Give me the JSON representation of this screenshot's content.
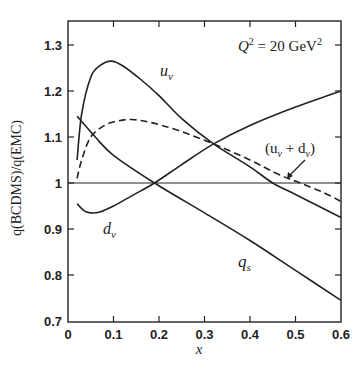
{
  "chart_data": {
    "type": "line",
    "title": "",
    "annotation": "Q² = 20 GeV²",
    "annotation_parts": {
      "q": "Q",
      "sup1": "2",
      "eq": " = 20 GeV",
      "sup2": "2"
    },
    "xlabel": "x",
    "ylabel": "q(BCDMS)/q(EMC)",
    "xlim": [
      0,
      0.6
    ],
    "ylim": [
      0.7,
      1.35
    ],
    "xticks": [
      "0",
      "0.1",
      "0.2",
      "0.3",
      "0.4",
      "0.5",
      "0.6"
    ],
    "yticks": [
      "0.7",
      "0.8",
      "0.9",
      "1",
      "1.1",
      "1.2",
      "1.3"
    ],
    "grid": false,
    "reference_line": 1.0,
    "series": [
      {
        "name": "u_v",
        "label": "u",
        "label_sub": "v",
        "style": "solid",
        "x": [
          0.02,
          0.03,
          0.05,
          0.07,
          0.095,
          0.12,
          0.16,
          0.2,
          0.25,
          0.32,
          0.4,
          0.45,
          0.5,
          0.55,
          0.6
        ],
        "y": [
          1.05,
          1.15,
          1.23,
          1.255,
          1.265,
          1.255,
          1.225,
          1.19,
          1.14,
          1.085,
          1.035,
          1.0,
          0.975,
          0.95,
          0.925
        ]
      },
      {
        "name": "d_v",
        "label": "d",
        "label_sub": "v",
        "style": "solid",
        "x": [
          0.02,
          0.035,
          0.05,
          0.07,
          0.1,
          0.14,
          0.19,
          0.25,
          0.32,
          0.4,
          0.5,
          0.6
        ],
        "y": [
          0.955,
          0.94,
          0.935,
          0.937,
          0.95,
          0.972,
          1.0,
          1.04,
          1.085,
          1.125,
          1.165,
          1.2
        ]
      },
      {
        "name": "(u_v + d_v)",
        "label": "(u",
        "label_sub": "v",
        "label_mid": " + d",
        "label_sub2": "v",
        "label_end": ")",
        "style": "dashed",
        "x": [
          0.02,
          0.03,
          0.05,
          0.08,
          0.11,
          0.14,
          0.18,
          0.24,
          0.32,
          0.4,
          0.46,
          0.51,
          0.56,
          0.6
        ],
        "y": [
          1.01,
          1.05,
          1.1,
          1.125,
          1.135,
          1.138,
          1.132,
          1.115,
          1.085,
          1.05,
          1.02,
          1.0,
          0.98,
          0.96
        ]
      },
      {
        "name": "q_s",
        "label": "q",
        "label_sub": "s",
        "style": "solid",
        "x": [
          0.02,
          0.06,
          0.1,
          0.19,
          0.3,
          0.4,
          0.5,
          0.6
        ],
        "y": [
          1.145,
          1.1,
          1.06,
          1.0,
          0.935,
          0.875,
          0.81,
          0.745
        ]
      }
    ]
  }
}
